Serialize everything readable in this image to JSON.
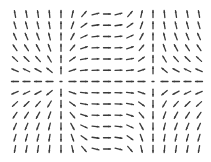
{
  "chart_data": {
    "type": "quiver",
    "title": "",
    "xlabel": "",
    "ylabel": "",
    "grid": false,
    "legend": null,
    "columns": 17,
    "rows": 13,
    "x_pixel_range": [
      15,
      199
    ],
    "y_pixel_range": [
      14,
      149
    ],
    "x_domain": [
      -3.1416,
      3.1416
    ],
    "y_domain": [
      1.2,
      -1.2
    ],
    "field": {
      "u": "cos(x) * cos(y)",
      "v": "sin(y) * (1 - cos(x)) / 2 + sin(y) * 0.0"
    },
    "arrow_length_px": 7,
    "arrow_color": "#3a3a3a",
    "null_points_px": [
      [
        63,
        81
      ],
      [
        152,
        81
      ]
    ]
  },
  "colors": {
    "background": "#ffffff",
    "arrow": "#3a3a3a"
  }
}
